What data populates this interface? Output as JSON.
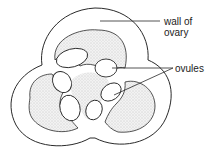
{
  "diagram": {
    "labels": {
      "wall": "wall of",
      "wall_line2": "ovary",
      "ovules": "ovules"
    },
    "colors": {
      "line": "#2a2a2a",
      "stipple": "#d8d8d8",
      "background": "#ffffff"
    }
  }
}
